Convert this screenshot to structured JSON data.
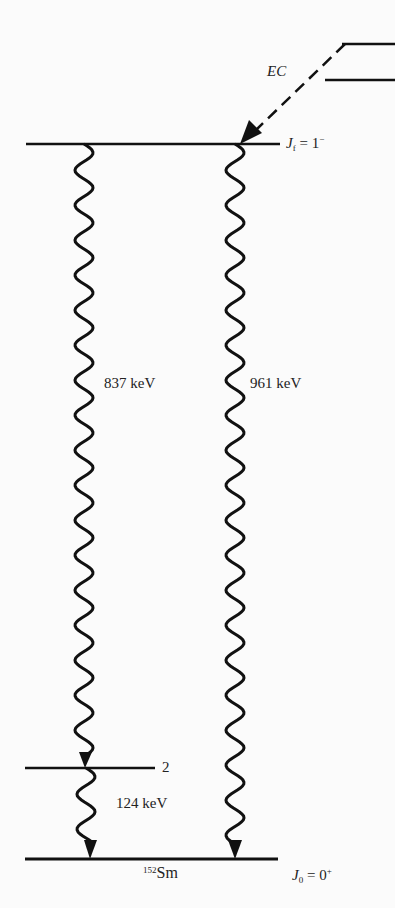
{
  "diagram": {
    "type": "nuclear-decay-scheme",
    "nucleus": {
      "mass_number": "152",
      "symbol": "Sm"
    },
    "process_label": "EC",
    "levels": [
      {
        "id": "initial",
        "spin_symbol": "J",
        "spin_sub": "f",
        "equals": "=",
        "value": "1",
        "parity": "−"
      },
      {
        "id": "intermediate",
        "label": "2"
      },
      {
        "id": "ground",
        "spin_symbol": "J",
        "spin_sub": "0",
        "equals": "=",
        "value": "0",
        "parity": "+"
      }
    ],
    "transitions": [
      {
        "from": "initial",
        "to": "intermediate",
        "energy": "837 keV"
      },
      {
        "from": "initial",
        "to": "ground",
        "energy": "961 keV"
      },
      {
        "from": "intermediate",
        "to": "ground",
        "energy": "124 keV"
      }
    ],
    "colors": {
      "ink": "#111111",
      "background": "#fbfbfb"
    }
  }
}
